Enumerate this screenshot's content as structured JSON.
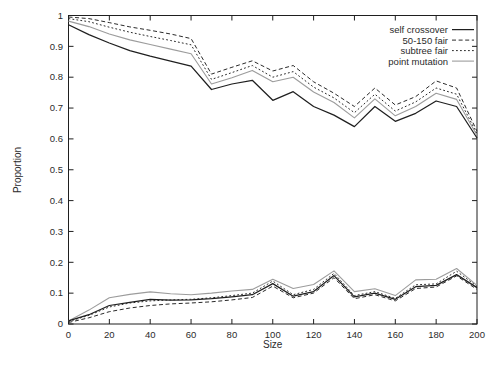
{
  "chart_data": {
    "type": "line",
    "title": "",
    "xlabel": "Size",
    "ylabel": "Proportion",
    "xlim": [
      0,
      200
    ],
    "ylim": [
      0,
      1
    ],
    "x_ticks": [
      0,
      20,
      40,
      60,
      80,
      100,
      120,
      140,
      160,
      180,
      200
    ],
    "y_ticks": [
      "0",
      "0.1",
      "0.2",
      "0.3",
      "0.4",
      "0.5",
      "0.6",
      "0.7",
      "0.8",
      "0.9",
      "1"
    ],
    "grid": false,
    "legend_position": "top-right-inside",
    "frame": "box-with-mirrored-ticks",
    "x": [
      0,
      10,
      20,
      30,
      40,
      50,
      60,
      70,
      80,
      90,
      100,
      110,
      120,
      130,
      140,
      150,
      160,
      170,
      180,
      190,
      200
    ],
    "series": [
      {
        "name": "self crossover",
        "style": "solid",
        "color": "#1f1f1f",
        "width": 1.25,
        "dash": "",
        "upper": [
          0.97,
          0.938,
          0.911,
          0.886,
          0.868,
          0.852,
          0.836,
          0.76,
          0.778,
          0.79,
          0.725,
          0.753,
          0.705,
          0.677,
          0.64,
          0.705,
          0.657,
          0.683,
          0.723,
          0.705,
          0.603
        ],
        "lower": [
          0.01,
          0.03,
          0.06,
          0.07,
          0.08,
          0.077,
          0.078,
          0.082,
          0.088,
          0.095,
          0.131,
          0.09,
          0.105,
          0.157,
          0.088,
          0.1,
          0.08,
          0.121,
          0.125,
          0.16,
          0.118
        ]
      },
      {
        "name": "50-150 fair",
        "style": "dashed",
        "color": "#2a2a2a",
        "width": 1.0,
        "dash": "4,2.6",
        "upper": [
          0.995,
          0.99,
          0.977,
          0.963,
          0.952,
          0.94,
          0.925,
          0.81,
          0.832,
          0.853,
          0.82,
          0.838,
          0.785,
          0.748,
          0.705,
          0.765,
          0.71,
          0.737,
          0.788,
          0.765,
          0.625
        ],
        "lower": [
          0.005,
          0.02,
          0.04,
          0.052,
          0.06,
          0.065,
          0.068,
          0.072,
          0.078,
          0.086,
          0.123,
          0.085,
          0.1,
          0.15,
          0.082,
          0.095,
          0.075,
          0.115,
          0.12,
          0.156,
          0.112
        ]
      },
      {
        "name": "subtree fair",
        "style": "fine-dashed",
        "color": "#2a2a2a",
        "width": 1.0,
        "dash": "1.8,2.2",
        "upper": [
          0.99,
          0.98,
          0.962,
          0.946,
          0.932,
          0.919,
          0.905,
          0.793,
          0.815,
          0.838,
          0.8,
          0.818,
          0.768,
          0.733,
          0.685,
          0.745,
          0.69,
          0.72,
          0.765,
          0.745,
          0.617
        ],
        "lower": [
          0.008,
          0.028,
          0.055,
          0.068,
          0.075,
          0.078,
          0.08,
          0.085,
          0.092,
          0.1,
          0.139,
          0.095,
          0.112,
          0.164,
          0.092,
          0.105,
          0.083,
          0.127,
          0.13,
          0.171,
          0.122
        ]
      },
      {
        "name": "point mutation",
        "style": "solid",
        "color": "#9c9c9c",
        "width": 1.1,
        "dash": "",
        "upper": [
          0.982,
          0.964,
          0.94,
          0.921,
          0.906,
          0.891,
          0.876,
          0.778,
          0.798,
          0.822,
          0.785,
          0.8,
          0.752,
          0.718,
          0.668,
          0.73,
          0.675,
          0.705,
          0.748,
          0.728,
          0.612
        ],
        "lower": [
          0.01,
          0.045,
          0.085,
          0.096,
          0.104,
          0.098,
          0.095,
          0.1,
          0.107,
          0.112,
          0.145,
          0.115,
          0.128,
          0.172,
          0.105,
          0.114,
          0.092,
          0.143,
          0.145,
          0.18,
          0.125
        ]
      }
    ]
  },
  "colors": {
    "frame": "#1f1f1f",
    "tick_text": "#2b2b2b",
    "background": "#ffffff"
  }
}
